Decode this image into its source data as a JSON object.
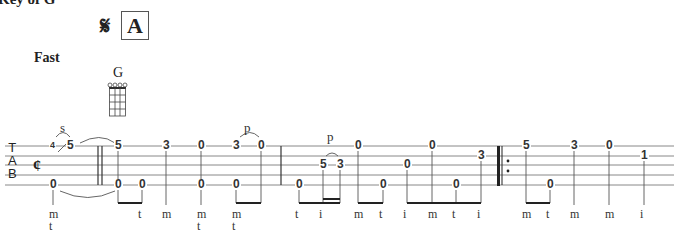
{
  "header": {
    "key": "Key of G",
    "segno": "𝄋",
    "rehearsal_mark": "A",
    "tempo": "Fast",
    "chord": "G"
  },
  "tab": {
    "clef": [
      "T",
      "A",
      "B"
    ],
    "time_signature": "¢",
    "techniques": [
      {
        "label": "s",
        "x": 60,
        "y": 120
      },
      {
        "label": "p",
        "x": 244,
        "y": 120
      },
      {
        "label": "p",
        "x": 327,
        "y": 129
      }
    ],
    "notes": [
      {
        "fret": "4",
        "x": 53,
        "y": 146,
        "small": true
      },
      {
        "fret": "5",
        "x": 70,
        "y": 146
      },
      {
        "fret": "0",
        "x": 53,
        "y": 185
      },
      {
        "fret": "5",
        "x": 118,
        "y": 146
      },
      {
        "fret": "0",
        "x": 118,
        "y": 185
      },
      {
        "fret": "0",
        "x": 142,
        "y": 185
      },
      {
        "fret": "3",
        "x": 166,
        "y": 146
      },
      {
        "fret": "0",
        "x": 201,
        "y": 146
      },
      {
        "fret": "0",
        "x": 201,
        "y": 185
      },
      {
        "fret": "3",
        "x": 236,
        "y": 146
      },
      {
        "fret": "0",
        "x": 261,
        "y": 146
      },
      {
        "fret": "0",
        "x": 236,
        "y": 185
      },
      {
        "fret": "0",
        "x": 299,
        "y": 185
      },
      {
        "fret": "5",
        "x": 323,
        "y": 165
      },
      {
        "fret": "3",
        "x": 340,
        "y": 165
      },
      {
        "fret": "0",
        "x": 358,
        "y": 146
      },
      {
        "fret": "0",
        "x": 383,
        "y": 185
      },
      {
        "fret": "0",
        "x": 407,
        "y": 165
      },
      {
        "fret": "0",
        "x": 432,
        "y": 146
      },
      {
        "fret": "0",
        "x": 456,
        "y": 185
      },
      {
        "fret": "3",
        "x": 481,
        "y": 156
      },
      {
        "fret": "5",
        "x": 526,
        "y": 146
      },
      {
        "fret": "0",
        "x": 550,
        "y": 185
      },
      {
        "fret": "3",
        "x": 574,
        "y": 146
      },
      {
        "fret": "0",
        "x": 609,
        "y": 146
      },
      {
        "fret": "1",
        "x": 644,
        "y": 156
      }
    ],
    "fingerings": [
      {
        "x": 53,
        "lines": [
          "m",
          "t"
        ]
      },
      {
        "x": 142,
        "lines": [
          "t"
        ]
      },
      {
        "x": 166,
        "lines": [
          "m"
        ]
      },
      {
        "x": 201,
        "lines": [
          "m",
          "t"
        ]
      },
      {
        "x": 236,
        "lines": [
          "m",
          "t"
        ]
      },
      {
        "x": 299,
        "lines": [
          "t"
        ]
      },
      {
        "x": 323,
        "lines": [
          "i"
        ]
      },
      {
        "x": 358,
        "lines": [
          "m"
        ]
      },
      {
        "x": 383,
        "lines": [
          "t"
        ]
      },
      {
        "x": 407,
        "lines": [
          "i"
        ]
      },
      {
        "x": 432,
        "lines": [
          "m"
        ]
      },
      {
        "x": 456,
        "lines": [
          "t"
        ]
      },
      {
        "x": 481,
        "lines": [
          "i"
        ]
      },
      {
        "x": 526,
        "lines": [
          "m"
        ]
      },
      {
        "x": 550,
        "lines": [
          "t"
        ]
      },
      {
        "x": 574,
        "lines": [
          "m"
        ]
      },
      {
        "x": 609,
        "lines": [
          "m"
        ]
      },
      {
        "x": 644,
        "lines": [
          "i"
        ]
      }
    ]
  }
}
